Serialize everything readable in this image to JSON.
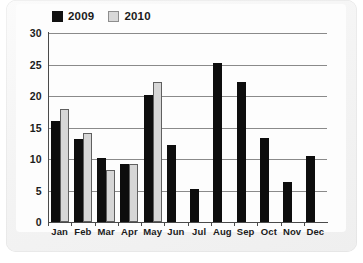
{
  "legend": {
    "entries": [
      {
        "label": "2009",
        "color": "#111111",
        "swatch": "black-square-swatch"
      },
      {
        "label": "2010",
        "color": "#d8d8d8",
        "swatch": "gray-square-swatch"
      }
    ]
  },
  "axis": {
    "yticks": [
      "0",
      "5",
      "10",
      "15",
      "20",
      "25",
      "30"
    ]
  },
  "chart_data": {
    "type": "bar",
    "title": "",
    "subtitle": "",
    "xlabel": "",
    "ylabel": "",
    "ylim": [
      0,
      30
    ],
    "ytick_values": [
      0,
      5,
      10,
      15,
      20,
      25,
      30
    ],
    "grid": true,
    "grid_axis": "y",
    "legend_position": "top-left",
    "categories": [
      "Jan",
      "Feb",
      "Mar",
      "Apr",
      "May",
      "Jun",
      "Jul",
      "Aug",
      "Sep",
      "Oct",
      "Nov",
      "Dec"
    ],
    "series": [
      {
        "name": "2009",
        "color": "#0d0d0d",
        "values": [
          16.0,
          13.2,
          10.2,
          9.2,
          20.2,
          12.3,
          5.2,
          25.3,
          22.3,
          13.4,
          6.4,
          10.4
        ]
      },
      {
        "name": "2010",
        "color": "#d6d6d6",
        "values": [
          18.0,
          14.2,
          8.2,
          9.2,
          22.3,
          null,
          null,
          null,
          null,
          null,
          null,
          null
        ]
      }
    ]
  }
}
